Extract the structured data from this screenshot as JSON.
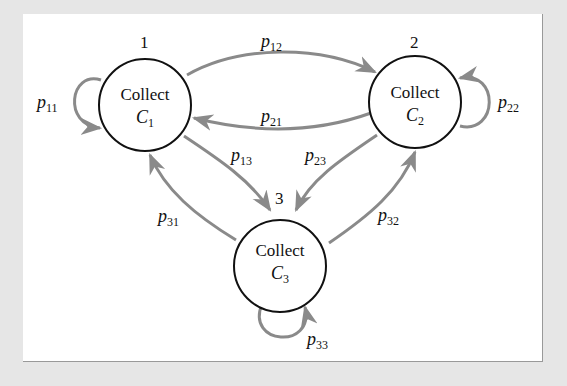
{
  "diagram": {
    "nodes": [
      {
        "id": "1",
        "number": "1",
        "label": "Collect",
        "symbol": "C",
        "subscript": "1"
      },
      {
        "id": "2",
        "number": "2",
        "label": "Collect",
        "symbol": "C",
        "subscript": "2"
      },
      {
        "id": "3",
        "number": "3",
        "label": "Collect",
        "symbol": "C",
        "subscript": "3"
      }
    ],
    "edges": [
      {
        "from": "1",
        "to": "1",
        "label": "p",
        "sub": "11"
      },
      {
        "from": "1",
        "to": "2",
        "label": "p",
        "sub": "12"
      },
      {
        "from": "2",
        "to": "1",
        "label": "p",
        "sub": "21"
      },
      {
        "from": "2",
        "to": "2",
        "label": "p",
        "sub": "22"
      },
      {
        "from": "1",
        "to": "3",
        "label": "p",
        "sub": "13"
      },
      {
        "from": "2",
        "to": "3",
        "label": "p",
        "sub": "23"
      },
      {
        "from": "3",
        "to": "1",
        "label": "p",
        "sub": "31"
      },
      {
        "from": "3",
        "to": "2",
        "label": "p",
        "sub": "32"
      },
      {
        "from": "3",
        "to": "3",
        "label": "p",
        "sub": "33"
      }
    ],
    "colors": {
      "edge": "#8a8a8a",
      "node_stroke": "#111111",
      "background": "#e6e6e6",
      "panel": "#ffffff"
    }
  }
}
